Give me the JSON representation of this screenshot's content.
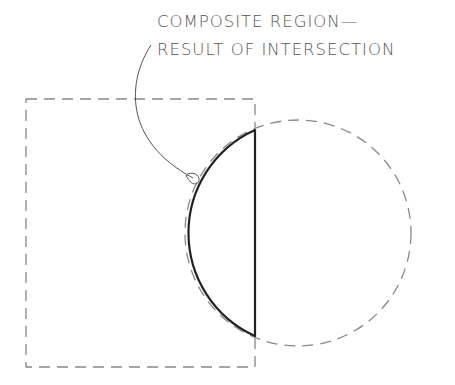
{
  "diagram": {
    "annotation": {
      "line1": "COMPOSITE REGION—",
      "line2": "RESULT OF INTERSECTION"
    },
    "shapes": {
      "rectangle": {
        "style": "dashed",
        "description": "rectangle region"
      },
      "circle": {
        "style": "dashed",
        "description": "circle region"
      },
      "intersection": {
        "style": "solid-bold",
        "description": "composite region - result of intersection (half-disc)"
      },
      "leader": {
        "style": "thin-curved-arrow"
      }
    },
    "colors": {
      "dashed_stroke": "#888888",
      "solid_stroke": "#222222",
      "text": "#555555",
      "background": "#ffffff"
    }
  }
}
